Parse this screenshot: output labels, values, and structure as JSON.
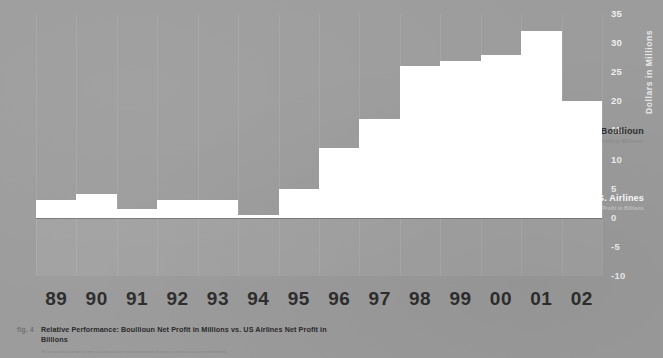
{
  "figure": {
    "fig_label": "fig. 4",
    "caption": "Relative Performance: Boullioun Net Profit in Millions vs. US Airlines Net Profit in Billions",
    "footnote": "*Before tax and extraordinary items; excludes valuation provision reversals, incorporates purchase accounting adjustments."
  },
  "legend": {
    "boullioun": {
      "name": "Boullioun",
      "subtitle": "Net Profit in Millions*"
    },
    "usairlines": {
      "name": "U.S. Airlines",
      "subtitle": "Net Profit in Billions"
    }
  },
  "chart_data": {
    "type": "bar",
    "title": "Relative Performance: Boullioun Net Profit in Millions vs. US Airlines Net Profit in Billions",
    "xlabel": "",
    "ylabel": "Dollars in Millions",
    "ylim": [
      -10,
      35
    ],
    "yticks": [
      35,
      30,
      25,
      20,
      15,
      10,
      5,
      0,
      -5,
      -10
    ],
    "grid": false,
    "legend_position": "inside-right",
    "categories": [
      "89",
      "90",
      "91",
      "92",
      "93",
      "94",
      "95",
      "96",
      "97",
      "98",
      "99",
      "00",
      "01",
      "02"
    ],
    "series": [
      {
        "name": "Boullioun",
        "subtitle": "Net Profit in Millions*",
        "color": "#ffffff",
        "values": [
          3,
          4,
          1.5,
          3,
          3,
          0.5,
          5,
          12,
          17,
          26,
          27,
          28,
          32,
          20
        ]
      },
      {
        "name": "U.S. Airlines",
        "subtitle": "Net Profit in Billions",
        "color": "#a9a9a9",
        "values": [
          0.2,
          0.2,
          0.2,
          0.2,
          0.2,
          0.2,
          1,
          2,
          4,
          4,
          4.5,
          4.5,
          2,
          0.2
        ]
      }
    ]
  },
  "colors": {
    "background": "#9c9c9c",
    "boullioun_bar": "#ffffff",
    "usairlines_bar": "#a9a9a9",
    "axis_text_light": "#efefef",
    "axis_text_dark": "#2e2e2e"
  }
}
